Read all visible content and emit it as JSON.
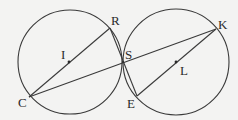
{
  "diagram": {
    "background": "#f3f3f2",
    "stroke_color": "#3a3a3a",
    "circles": [
      {
        "name": "circle-I",
        "center": "I",
        "cx": 70,
        "cy": 62,
        "r": 52
      },
      {
        "name": "circle-L",
        "center": "L",
        "cx": 178,
        "cy": 62,
        "r": 52
      }
    ],
    "points": {
      "C": {
        "label": "C",
        "x": 29,
        "y": 97
      },
      "R": {
        "label": "R",
        "x": 110,
        "y": 28
      },
      "I": {
        "label": "I",
        "x": 69,
        "y": 62
      },
      "S": {
        "label": "S",
        "x": 123,
        "y": 62
      },
      "E": {
        "label": "E",
        "x": 137,
        "y": 96
      },
      "K": {
        "label": "K",
        "x": 216,
        "y": 29
      },
      "L": {
        "label": "L",
        "x": 176,
        "y": 62
      }
    },
    "segments": [
      [
        "C",
        "R"
      ],
      [
        "C",
        "K"
      ],
      [
        "R",
        "E"
      ],
      [
        "E",
        "K"
      ]
    ],
    "labels": {
      "C": "C",
      "R": "R",
      "I": "I",
      "S": "S",
      "E": "E",
      "K": "K",
      "L": "L"
    }
  }
}
